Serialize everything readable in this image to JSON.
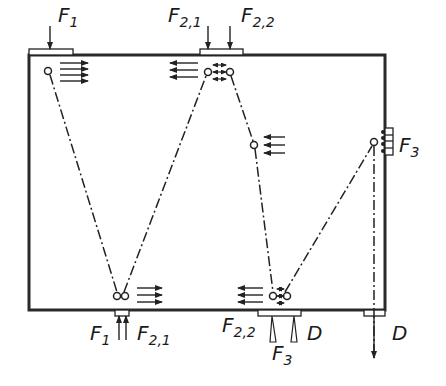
{
  "diagram": {
    "type": "rope-pulley load path schematic",
    "frame": {
      "x1": 29,
      "y1": 55,
      "x2": 385,
      "y2": 310,
      "stroke": "#2a2a2a"
    },
    "nodes": [
      {
        "id": "n1",
        "x": 48,
        "y": 71,
        "kind": "single"
      },
      {
        "id": "n2",
        "x": 120,
        "y": 296,
        "kind": "double"
      },
      {
        "id": "n3",
        "x": 209,
        "y": 72,
        "kind": "double-with-arrows"
      },
      {
        "id": "n4",
        "x": 254,
        "y": 145,
        "kind": "single"
      },
      {
        "id": "n5",
        "x": 279,
        "y": 296,
        "kind": "double-with-arrows"
      },
      {
        "id": "n6",
        "x": 374,
        "y": 142,
        "kind": "single"
      }
    ],
    "segments": [
      [
        "n1",
        "n2"
      ],
      [
        "n2",
        "n3"
      ],
      [
        "n3",
        "n4"
      ],
      [
        "n4",
        "n5"
      ],
      [
        "n5",
        "n6"
      ]
    ],
    "labels": {
      "top_f1": {
        "base": "F",
        "sub": "1"
      },
      "top_f21": {
        "base": "F",
        "sub": "2,1"
      },
      "top_f22": {
        "base": "F",
        "sub": "2,2"
      },
      "right_f3": {
        "base": "F",
        "sub": "3"
      },
      "bot_f1": {
        "base": "F",
        "sub": "1"
      },
      "bot_f21": {
        "base": "F",
        "sub": "2,1"
      },
      "bot_f22": {
        "base": "F",
        "sub": "2,2"
      },
      "bot_f3": {
        "base": "F",
        "sub": "3"
      },
      "bot_d": "D",
      "right_d": "D"
    }
  }
}
